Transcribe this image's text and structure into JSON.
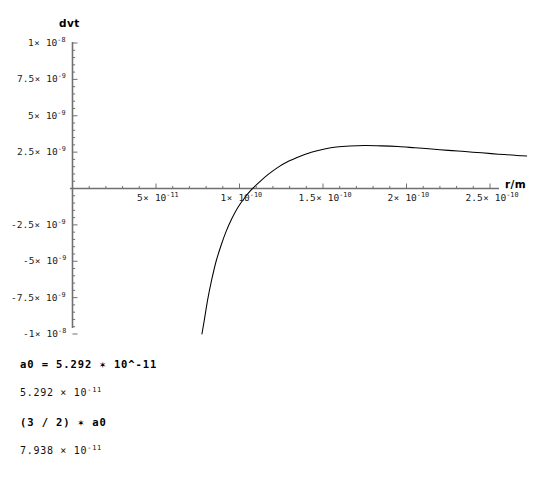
{
  "plot": {
    "y_axis_name": "dvt",
    "x_axis_name": "r/m"
  },
  "chart_data": {
    "type": "line",
    "title": "",
    "xlabel": "r/m",
    "ylabel": "dvt",
    "xlim": [
      0,
      2.85e-10
    ],
    "ylim": [
      -1e-08,
      1e-08
    ],
    "grid": false,
    "legend": "none",
    "x_tick_values": [
      5e-11,
      1e-10,
      1.5e-10,
      2e-10,
      2.5e-10
    ],
    "x_tick_labels": [
      "5× 10⁻¹¹",
      "1× 10⁻¹⁰",
      "1.5× 10⁻¹⁰",
      "2× 10⁻¹⁰",
      "2.5× 10⁻¹⁰"
    ],
    "x_ticks": [
      {
        "mantissa": "5",
        "exponent": "-11",
        "value": 5e-11
      },
      {
        "mantissa": "1",
        "exponent": "-10",
        "value": 1e-10
      },
      {
        "mantissa": "1.5",
        "exponent": "-10",
        "value": 1.5e-10
      },
      {
        "mantissa": "2",
        "exponent": "-10",
        "value": 2e-10
      },
      {
        "mantissa": "2.5",
        "exponent": "-10",
        "value": 2.5e-10
      }
    ],
    "y_tick_values": [
      1e-08,
      7.5e-09,
      5e-09,
      2.5e-09,
      -2.5e-09,
      -5e-09,
      -7.5e-09,
      -1e-08
    ],
    "y_tick_labels": [
      "1× 10⁻⁸",
      "7.5× 10⁻⁹",
      "5× 10⁻⁹",
      "2.5× 10⁻⁹",
      "-2.5× 10⁻⁹",
      "-5× 10⁻⁹",
      "-7.5× 10⁻⁹",
      "-1× 10⁻⁸"
    ],
    "y_ticks": [
      {
        "mantissa": "1",
        "exponent": "-8",
        "value": 1e-08
      },
      {
        "mantissa": "7.5",
        "exponent": "-9",
        "value": 7.5e-09
      },
      {
        "mantissa": "5",
        "exponent": "-9",
        "value": 5e-09
      },
      {
        "mantissa": "2.5",
        "exponent": "-9",
        "value": 2.5e-09
      },
      {
        "mantissa": "-2.5",
        "exponent": "-9",
        "value": -2.5e-09
      },
      {
        "mantissa": "-5",
        "exponent": "-9",
        "value": -5e-09
      },
      {
        "mantissa": "-7.5",
        "exponent": "-9",
        "value": -7.5e-09
      },
      {
        "mantissa": "-1",
        "exponent": "-8",
        "value": -1e-08
      }
    ],
    "series": [
      {
        "name": "dvt",
        "color": "#000000",
        "x": [
          7.75e-11,
          7.9e-11,
          8.1e-11,
          8.35e-11,
          8.6e-11,
          8.9e-11,
          9.2e-11,
          9.55e-11,
          9.9e-11,
          1.03e-10,
          1.07e-10,
          1.12e-10,
          1.17e-10,
          1.23e-10,
          1.29e-10,
          1.36e-10,
          1.43e-10,
          1.51e-10,
          1.58e-10,
          1.66e-10,
          1.75e-10,
          1.85e-10,
          1.95e-10,
          2.05e-10,
          2.15e-10,
          2.25e-10,
          2.35e-10,
          2.45e-10,
          2.55e-10,
          2.65e-10,
          2.72e-10
        ],
        "y": [
          -1e-08,
          -9e-09,
          -7.6e-09,
          -6.2e-09,
          -5e-09,
          -3.9e-09,
          -2.95e-09,
          -2.05e-09,
          -1.3e-09,
          -6.5e-10,
          -1e-10,
          4.5e-10,
          9.5e-10,
          1.45e-09,
          1.85e-09,
          2.2e-09,
          2.5e-09,
          2.72e-09,
          2.85e-09,
          2.92e-09,
          2.95e-09,
          2.93e-09,
          2.88e-09,
          2.8e-09,
          2.72e-09,
          2.62e-09,
          2.54e-09,
          2.45e-09,
          2.36e-09,
          2.28e-09,
          2.23e-09
        ]
      }
    ],
    "annotations": []
  },
  "notebook": {
    "cells": [
      {
        "type": "input",
        "text": "a0 = 5.292 ✶ 10^-11"
      },
      {
        "type": "output",
        "mantissa": "5.292 × 10",
        "exponent": "-11"
      },
      {
        "type": "input",
        "text": "(3 / 2) ✶ a0"
      },
      {
        "type": "output",
        "mantissa": "7.938 × 10",
        "exponent": "-11"
      }
    ],
    "in1": "a0 = 5.292 ✶ 10^-11",
    "out1_mantissa": "5.292 × 10",
    "out1_exponent": "-11",
    "in2": "(3 / 2) ✶ a0",
    "out2_mantissa": "7.938 × 10",
    "out2_exponent": "-11"
  },
  "colors": {
    "background": "#ffffff",
    "axis": "#606060",
    "curve": "#000000",
    "text": "#000000"
  }
}
